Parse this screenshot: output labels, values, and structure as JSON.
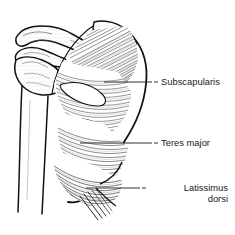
{
  "figure": {
    "title": "A. Anterior Wall",
    "view": "anterior",
    "style": "black-ink-line-drawing",
    "background_color": "#ffffff",
    "ink_color": "#111111"
  },
  "labels": [
    {
      "id": "subscapularis",
      "text": "Subscapularis",
      "leader_from": [
        105,
        82
      ],
      "leader_to": [
        158,
        82
      ]
    },
    {
      "id": "teres-major",
      "text": "Teres major",
      "leader_from": [
        82,
        143
      ],
      "leader_to": [
        158,
        143
      ]
    },
    {
      "id": "latissimus-dorsi",
      "line1": "Latissimus",
      "line2": "dorsi",
      "leader_from": [
        88,
        188
      ],
      "leader_to": [
        146,
        188
      ]
    }
  ],
  "structures": {
    "clavicle": "clavicle",
    "coracoid_process": "coracoid process",
    "acromion": "acromion",
    "scapula": "scapula",
    "humerus": "humerus shaft",
    "subscapularis": "subscapularis muscle",
    "teres_major": "teres major muscle",
    "latissimus_dorsi": "latissimus dorsi muscle"
  }
}
